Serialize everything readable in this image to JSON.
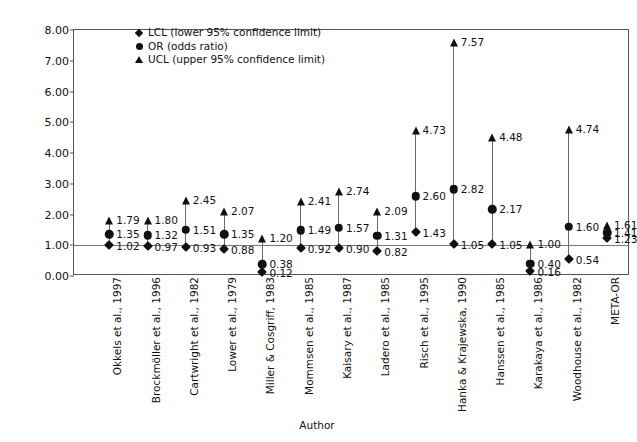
{
  "chart_data": {
    "type": "scatter",
    "title": "",
    "xlabel": "Author",
    "ylabel": "Odds ratio",
    "ylim": [
      0.0,
      8.0
    ],
    "ytick_labels": [
      "8.00",
      "7.00",
      "6.00",
      "5.00",
      "4.00",
      "3.00",
      "2.00",
      "1.00",
      "0.00"
    ],
    "ytick_values": [
      8,
      7,
      6,
      5,
      4,
      3,
      2,
      1,
      0
    ],
    "grid": false,
    "reference_line": 1.0,
    "legend_position": "top-center",
    "legend": [
      {
        "marker": "diamond",
        "label": "LCL (lower 95% confidence limit)"
      },
      {
        "marker": "circle",
        "label": "OR (odds ratio)"
      },
      {
        "marker": "triangle",
        "label": "UCL (upper 95% confidence limit)"
      }
    ],
    "categories": [
      "Okkels et al., 1997",
      "Brockmöller et al., 1996",
      "Cartwright et al., 1982",
      "Lower et al., 1979",
      "Miller & Cosgriff, 1983",
      "Mommsen et al., 1985",
      "Kaisary et al., 1987",
      "Ladero et al., 1985",
      "Risch et al., 1995",
      "Hanka & Krajewska, 1990",
      "Hanssen et al., 1985",
      "Karakaya et al., 1986",
      "Woodhouse et al., 1982",
      "META-OR"
    ],
    "series": [
      {
        "name": "LCL (lower 95% confidence limit)",
        "marker": "diamond",
        "values": [
          1.02,
          0.97,
          0.93,
          0.88,
          0.12,
          0.92,
          0.9,
          0.82,
          1.43,
          1.05,
          1.05,
          0.16,
          0.54,
          1.23
        ]
      },
      {
        "name": "OR (odds ratio)",
        "marker": "circle",
        "values": [
          1.35,
          1.32,
          1.51,
          1.35,
          0.38,
          1.49,
          1.57,
          1.31,
          2.6,
          2.82,
          2.17,
          0.4,
          1.6,
          1.41
        ]
      },
      {
        "name": "UCL (upper 95% confidence limit)",
        "marker": "triangle",
        "values": [
          1.79,
          1.8,
          2.45,
          2.07,
          1.2,
          2.41,
          2.74,
          2.09,
          4.73,
          7.57,
          4.48,
          1.0,
          4.74,
          1.61
        ]
      }
    ],
    "point_labels": {
      "lcl": [
        "1.02",
        "0.97",
        "0.93",
        "0.88",
        "0.12",
        "0.92",
        "0.90",
        "0.82",
        "1.43",
        "1.05",
        "1.05",
        "0.16",
        "0.54",
        "1.23"
      ],
      "or": [
        "1.35",
        "1.32",
        "1.51",
        "1.35",
        "0.38",
        "1.49",
        "1.57",
        "1.31",
        "2.60",
        "2.82",
        "2.17",
        "0.40",
        "1.60",
        "1.41"
      ],
      "ucl": [
        "1.79",
        "1.80",
        "2.45",
        "2.07",
        "1.20",
        "2.41",
        "2.74",
        "2.09",
        "4.73",
        "7.57",
        "4.48",
        "1.00",
        "4.74",
        "1.61"
      ]
    },
    "colors": {
      "marker": "#111111",
      "whisker": "#6a6a6a",
      "axis": "#555555",
      "reference": "#777777"
    }
  }
}
